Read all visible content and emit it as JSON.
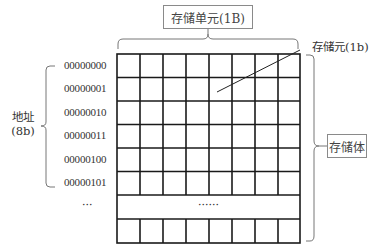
{
  "title_box": {
    "label": "存储单元(1B)"
  },
  "bit_label": {
    "label": "存储元(1b)"
  },
  "body_box": {
    "label": "存储体"
  },
  "address_label": {
    "line1": "地址",
    "line2": "(8b)"
  },
  "addresses": [
    "00000000",
    "00000001",
    "00000010",
    "00000011",
    "00000100",
    "00000101"
  ],
  "ellipsis_row": {
    "address": "···",
    "content": "······"
  },
  "grid": {
    "columns": 8,
    "rows_before_ellipsis": 7,
    "rows_after_ellipsis": 1
  },
  "colors": {
    "grid_line": "#1a1a1a",
    "brace_line": "#777777",
    "box_border": "#8a8a8a"
  }
}
